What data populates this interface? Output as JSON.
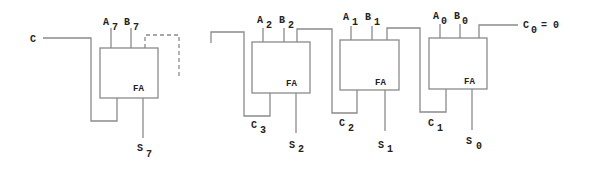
{
  "diagram": {
    "carry_in_left_label": "C",
    "blocks": [
      {
        "id": "fa7",
        "label": "FA",
        "a": {
          "main": "A",
          "sub": "7"
        },
        "b": {
          "main": "B",
          "sub": "7"
        },
        "s": {
          "main": "S",
          "sub": "7"
        }
      },
      {
        "id": "fa2",
        "label": "FA",
        "a": {
          "main": "A",
          "sub": "2"
        },
        "b": {
          "main": "B",
          "sub": "2"
        },
        "s": {
          "main": "S",
          "sub": "2"
        },
        "cout": {
          "main": "C",
          "sub": "3"
        }
      },
      {
        "id": "fa1",
        "label": "FA",
        "a": {
          "main": "A",
          "sub": "1"
        },
        "b": {
          "main": "B",
          "sub": "1"
        },
        "s": {
          "main": "S",
          "sub": "1"
        },
        "cout": {
          "main": "C",
          "sub": "2"
        }
      },
      {
        "id": "fa0",
        "label": "FA",
        "a": {
          "main": "A",
          "sub": "0"
        },
        "b": {
          "main": "B",
          "sub": "0"
        },
        "s": {
          "main": "S",
          "sub": "0"
        },
        "cout": {
          "main": "C",
          "sub": "1"
        }
      }
    ],
    "carry_zero": {
      "main": "C",
      "sub": "0",
      "suffix": "= 0"
    }
  }
}
